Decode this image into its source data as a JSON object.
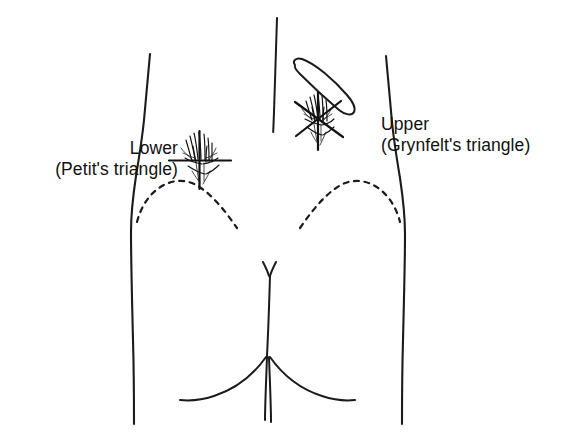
{
  "figure": {
    "background_color": "#ffffff",
    "ink_color": "#111111",
    "view": "posterior view of lower back and buttocks"
  },
  "labels": {
    "lower": {
      "line1": "Lower",
      "line2": "(Petit's triangle)",
      "position": "left"
    },
    "upper": {
      "line1": "Upper",
      "line2": "(Grynfelt's triangle)",
      "position": "right"
    }
  },
  "anatomy": {
    "parts": [
      {
        "name": "left-torso-outline",
        "kind": "solid-contour"
      },
      {
        "name": "right-torso-outline",
        "kind": "solid-contour"
      },
      {
        "name": "spine-line",
        "kind": "solid-line"
      },
      {
        "name": "twelfth-rib",
        "kind": "closed-outline"
      },
      {
        "name": "left-iliac-crest",
        "kind": "dashed-arc"
      },
      {
        "name": "right-iliac-crest",
        "kind": "dashed-arc"
      },
      {
        "name": "gluteal-cleft",
        "kind": "solid-line"
      },
      {
        "name": "left-gluteal-fold",
        "kind": "solid-curve"
      },
      {
        "name": "right-gluteal-fold",
        "kind": "solid-curve"
      }
    ],
    "markers": [
      {
        "name": "lower-triangle-marker",
        "style": "cross with hatched cloud",
        "refers_to": "Petit's triangle"
      },
      {
        "name": "upper-triangle-marker",
        "style": "star with hatched cloud",
        "refers_to": "Grynfelt's triangle"
      }
    ]
  }
}
